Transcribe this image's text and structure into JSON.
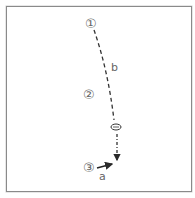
{
  "diagram": {
    "markers": [
      {
        "id": "1",
        "glyph": "①",
        "x": 90,
        "y": 23
      },
      {
        "id": "2",
        "glyph": "②",
        "x": 88,
        "y": 94
      },
      {
        "id": "3",
        "glyph": "③",
        "x": 88,
        "y": 166
      }
    ],
    "labels": {
      "b": "b",
      "a": "a"
    },
    "colors": {
      "line": "#2a2a2a",
      "text": "#666666",
      "border": "#8a8a8a"
    }
  }
}
